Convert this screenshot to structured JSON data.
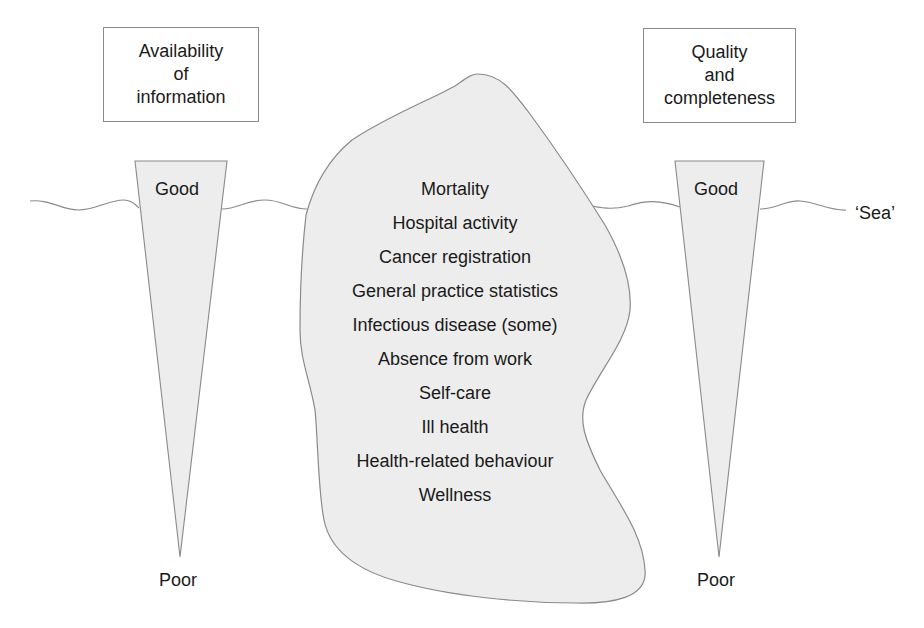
{
  "diagram": {
    "type": "iceberg",
    "left_box": {
      "lines": [
        "Availability",
        "of",
        "information"
      ]
    },
    "right_box": {
      "lines": [
        "Quality",
        "and",
        "completeness"
      ]
    },
    "left_scale": {
      "top_label": "Good",
      "bottom_label": "Poor"
    },
    "right_scale": {
      "top_label": "Good",
      "bottom_label": "Poor"
    },
    "sea_label": "‘Sea’",
    "iceberg_items": [
      "Mortality",
      "Hospital activity",
      "Cancer registration",
      "General practice statistics",
      "Infectious disease (some)",
      "Absence from work",
      "Self-care",
      "Ill health",
      "Health-related behaviour",
      "Wellness"
    ],
    "colors": {
      "fill": "#ededed",
      "stroke": "#8a8a8a",
      "text": "#1a1a1a"
    }
  }
}
